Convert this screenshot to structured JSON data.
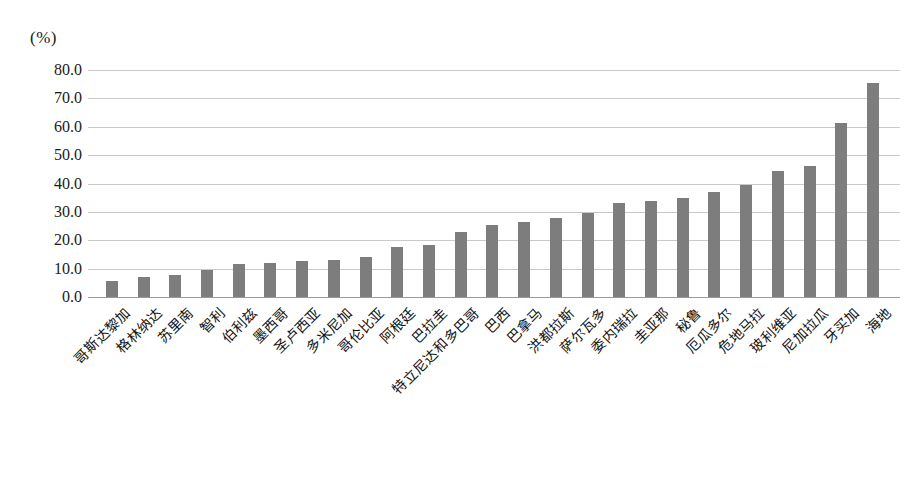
{
  "axis": {
    "unit_label": "(%)",
    "y_ticks": [
      "80.0",
      "70.0",
      "60.0",
      "50.0",
      "40.0",
      "30.0",
      "20.0",
      "10.0",
      "0.0"
    ]
  },
  "colors": {
    "bar": "#7d7d7d",
    "gridline": "#c9c9c9",
    "baseline": "#9a9a9a",
    "text": "#111111",
    "background": "#ffffff"
  },
  "chart_data": {
    "type": "bar",
    "title": "",
    "subtitle": "",
    "xlabel": "",
    "ylabel": "(%)",
    "ylim": [
      0,
      80
    ],
    "ytick_step": 10,
    "grid": true,
    "legend": false,
    "orientation": "vertical",
    "categories": [
      "哥斯达黎加",
      "格林纳达",
      "苏里南",
      "智利",
      "伯利兹",
      "墨西哥",
      "圣卢西亚",
      "多米尼加",
      "哥伦比亚",
      "阿根廷",
      "巴拉圭",
      "特立尼达和多巴哥",
      "巴西",
      "巴拿马",
      "洪都拉斯",
      "萨尔瓦多",
      "委内瑞拉",
      "圭亚那",
      "秘鲁",
      "厄瓜多尔",
      "危地马拉",
      "玻利维亚",
      "尼加拉瓜",
      "牙买加",
      "海地"
    ],
    "values": [
      5.7,
      7.0,
      7.7,
      9.5,
      11.5,
      12.0,
      12.8,
      13.2,
      14.0,
      17.8,
      18.5,
      23.0,
      25.5,
      26.5,
      28.0,
      29.5,
      33.0,
      34.0,
      35.0,
      37.0,
      39.5,
      44.5,
      46.0,
      61.5,
      75.5
    ]
  }
}
